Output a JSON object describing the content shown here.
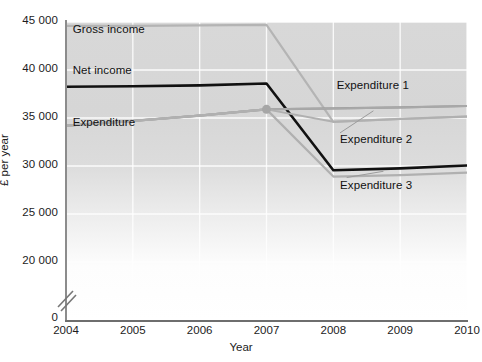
{
  "chart_data": {
    "type": "line",
    "title": "",
    "xlabel": "Year",
    "ylabel": "£ per year",
    "x": [
      2004,
      2005,
      2006,
      2007,
      2008,
      2009,
      2010
    ],
    "xlim": [
      2004,
      2010
    ],
    "ylim": [
      20000,
      45000
    ],
    "y_axis_break": true,
    "y_axis_zero_label": "0",
    "grid": true,
    "legend": "inline-annotations",
    "xticks": [
      "2004",
      "2005",
      "2006",
      "2007",
      "2008",
      "2009",
      "2010"
    ],
    "yticks": [
      "20000",
      "25000",
      "30000",
      "35000",
      "40000",
      "45000"
    ],
    "ytick_display": [
      "20 000",
      "25 000",
      "30 000",
      "35 000",
      "40 000",
      "45 000"
    ],
    "series": [
      {
        "name": "Gross income",
        "color": "#b4b4b4",
        "width": 2.2,
        "label_position": "top-left-inside",
        "values": [
          44600,
          44600,
          44650,
          44700,
          34600,
          34900,
          35150
        ]
      },
      {
        "name": "Net income",
        "color": "#111111",
        "width": 2.6,
        "label_position": "upper-left-inside",
        "values": [
          38250,
          38300,
          38400,
          38600,
          29550,
          29750,
          30050
        ]
      },
      {
        "name": "Expenditure",
        "color": "#9a9a9a",
        "width": 2.2,
        "label_position": "mid-left-inside",
        "values": [
          34200,
          34700,
          35250,
          35900,
          36000,
          36100,
          36250
        ]
      },
      {
        "name": "Expenditure 1",
        "color": "#a8a8a8",
        "width": 2.0,
        "label_position": "right-upper",
        "values": [
          34200,
          34700,
          35250,
          35900,
          36000,
          36100,
          36250
        ]
      },
      {
        "name": "Expenditure 2",
        "color": "#b0b0b0",
        "width": 2.0,
        "label_position": "right-middle",
        "values": [
          34200,
          34700,
          35250,
          35900,
          34600,
          34900,
          35150
        ]
      },
      {
        "name": "Expenditure 3",
        "color": "#b0b0b0",
        "width": 2.2,
        "label_position": "right-lower",
        "values": [
          34200,
          34700,
          35250,
          35900,
          28900,
          29050,
          29300
        ]
      }
    ],
    "markers": [
      {
        "x": 2007,
        "y": 35900,
        "color": "#a6a6a6",
        "shape": "circle",
        "size": 9
      }
    ],
    "annotations": [
      {
        "text": "Gross income",
        "x": 2004.1,
        "y": 44050
      },
      {
        "text": "Net income",
        "x": 2004.1,
        "y": 39800
      },
      {
        "text": "Expenditure",
        "x": 2004.1,
        "y": 34400
      },
      {
        "text": "Expenditure 1",
        "x": 2008.05,
        "y": 38200
      },
      {
        "text": "Expenditure 2",
        "x": 2008.1,
        "y": 32650
      },
      {
        "text": "Expenditure 3",
        "x": 2008.1,
        "y": 27850
      }
    ],
    "leader_lines": [
      {
        "from_x": 2008.1,
        "from_y": 33450,
        "to_x": 2008.6,
        "to_y": 35750
      },
      {
        "from_x": 2008.2,
        "from_y": 28800,
        "to_x": 2008.75,
        "to_y": 29450
      }
    ]
  }
}
